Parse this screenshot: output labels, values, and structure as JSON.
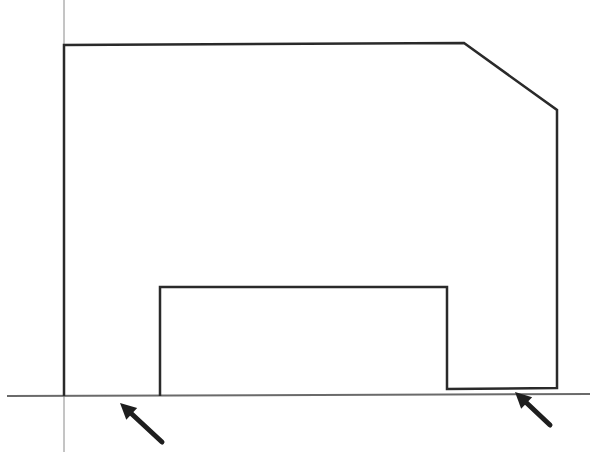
{
  "diagram": {
    "colors": {
      "background": "#ffffff",
      "outline": "#2a2a2a",
      "axis": "#8a8a8a",
      "baseline": "#6a6a6a",
      "arrow": "#1e1e1e"
    },
    "vertical_axis": {
      "x": 64,
      "y1": 0,
      "y2": 452
    },
    "baseline": {
      "x1": 7,
      "y1": 396,
      "x2": 590,
      "y2": 394
    },
    "profile_points": "64,396 64,45 464,43 557,110 557,388 447,389 447,287 160,287 160,396",
    "arrows": [
      {
        "name": "left-contact-arrow",
        "tip_x": 120,
        "tip_y": 403,
        "tail_x": 162,
        "tail_y": 442
      },
      {
        "name": "right-contact-arrow",
        "tip_x": 515,
        "tip_y": 392,
        "tail_x": 550,
        "tail_y": 425
      }
    ]
  }
}
